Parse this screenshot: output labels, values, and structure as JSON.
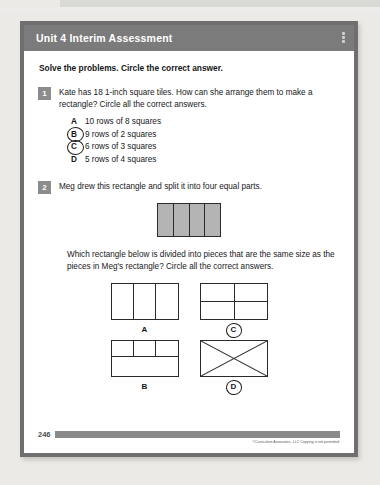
{
  "document": {
    "header": {
      "title": "Unit 4 Interim Assessment",
      "menu_icon": "vertical-dots-icon"
    },
    "directions": "Solve the problems. Circle the correct answer.",
    "questions": [
      {
        "number": "1",
        "prompt": "Kate has 18 1-inch square tiles. How can she arrange them to make a rectangle? Circle all the correct answers.",
        "choices": [
          {
            "letter": "A",
            "text": "10 rows of 8 squares",
            "circled": false
          },
          {
            "letter": "B",
            "text": "9 rows of 2 squares",
            "circled": true
          },
          {
            "letter": "C",
            "text": "6 rows of 3 squares",
            "circled": true
          },
          {
            "letter": "D",
            "text": "5 rows of 4 squares",
            "circled": false
          }
        ]
      },
      {
        "number": "2",
        "prompt": "Meg drew this rectangle and split it into four equal parts.",
        "figure": {
          "type": "rectangle-four-vertical-parts",
          "parts": 4,
          "fill": "#b4b4b4"
        },
        "subprompt": "Which rectangle below is divided into pieces that are the same size as the pieces in Meg's rectangle? Circle all the correct answers.",
        "choices": [
          {
            "letter": "A",
            "figure": "three-vertical-parts",
            "circled": false
          },
          {
            "letter": "C",
            "figure": "two-by-two-grid",
            "circled": true
          },
          {
            "letter": "B",
            "figure": "top-row-thirds-bottom-whole",
            "circled": false
          },
          {
            "letter": "D",
            "figure": "two-diagonals-x",
            "circled": true
          }
        ]
      }
    ],
    "footer": {
      "page_number": "246",
      "copyright": "©Curriculum Associates, LLC   Copying is not permitted."
    }
  },
  "colors": {
    "header_bar": "#7b7b7b",
    "frame": "#6f6f6f",
    "question_number_box": "#8c8c8c",
    "figure_fill": "#b4b4b4",
    "footer_bar": "#8a8a8a"
  }
}
